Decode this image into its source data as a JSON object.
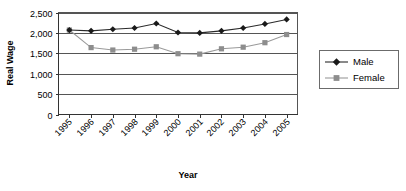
{
  "chart_data": {
    "type": "line",
    "title": "",
    "xlabel": "Year",
    "ylabel": "Real Wage",
    "categories": [
      "1995",
      "1996",
      "1997",
      "1998",
      "1999",
      "2000",
      "2001",
      "2002",
      "2003",
      "2004",
      "2005"
    ],
    "series": [
      {
        "name": "Male",
        "marker": "diamond",
        "color": "#1a1a1a",
        "values": [
          2070,
          2050,
          2090,
          2120,
          2230,
          2010,
          2000,
          2050,
          2120,
          2220,
          2330
        ]
      },
      {
        "name": "Female",
        "marker": "square",
        "color": "#8d8d8d",
        "values": [
          2070,
          1640,
          1580,
          1600,
          1660,
          1490,
          1480,
          1610,
          1650,
          1760,
          1960
        ]
      }
    ],
    "ylim": [
      0,
      2500
    ],
    "yticks": [
      0,
      500,
      1000,
      1500,
      2000,
      2500
    ],
    "ytick_labels": [
      "0",
      "500",
      "1,000",
      "1,500",
      "2,000",
      "2,500"
    ],
    "grid": true,
    "legend_position": "right",
    "legend_entries": [
      "Male",
      "Female"
    ]
  },
  "axes": {
    "y_title": "Real Wage",
    "x_title": "Year"
  },
  "legend": {
    "items": [
      {
        "label": "Male"
      },
      {
        "label": "Female"
      }
    ]
  }
}
